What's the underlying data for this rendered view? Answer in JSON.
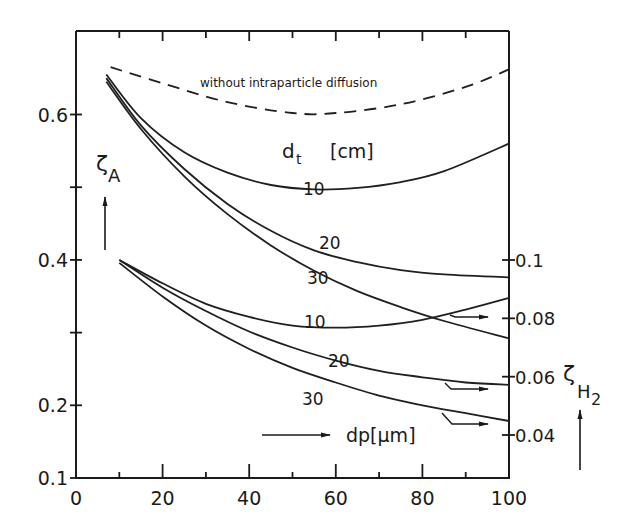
{
  "chart_data": {
    "type": "line",
    "title": "",
    "xlabel": "dp [µm]",
    "ylabel_left": "ζA",
    "ylabel_right": "ζH2",
    "xlim": [
      0,
      100
    ],
    "ylim_left": [
      0.1,
      0.7
    ],
    "ylim_right": [
      0.03,
      0.1
    ],
    "x_ticks": [
      0,
      20,
      40,
      60,
      80,
      100
    ],
    "x_ticks_labels": [
      "0",
      "20",
      "40",
      "60",
      "80",
      "100"
    ],
    "y_left_ticks_labels": [
      "0.1",
      "0.2",
      "0.4",
      "0.6"
    ],
    "y_left_ticks": [
      0.1,
      0.2,
      0.3,
      0.4,
      0.5,
      0.6
    ],
    "y_right_ticks_labels": [
      "0.04",
      "0.06",
      "0.08",
      "0.1"
    ],
    "y_right_ticks": [
      0.04,
      0.06,
      0.08,
      0.1
    ],
    "grid": false,
    "annotations": {
      "dashed_label": "without intraparticle diffusion",
      "dt_label": "d",
      "dt_sub": "t",
      "dt_unit": "[cm]",
      "x_arrow_label": "dp[µm]",
      "y_left_symbol": "ζ",
      "y_left_sub": "A",
      "y_right_symbol": "ζ",
      "y_right_sub": "H",
      "y_right_sub2": "2"
    },
    "series": [
      {
        "name": "without intraparticle diffusion",
        "axis": "left",
        "style": "dashed",
        "x": [
          8,
          20,
          35,
          50,
          60,
          75,
          90,
          100
        ],
        "values": [
          0.665,
          0.643,
          0.617,
          0.602,
          0.602,
          0.614,
          0.638,
          0.662
        ]
      },
      {
        "name": "ζA dt=10 cm",
        "axis": "left",
        "label": "10",
        "x": [
          7,
          15,
          25,
          35,
          45,
          55,
          65,
          75,
          85,
          100
        ],
        "values": [
          0.655,
          0.595,
          0.548,
          0.52,
          0.503,
          0.497,
          0.499,
          0.507,
          0.522,
          0.56
        ]
      },
      {
        "name": "ζA dt=20 cm",
        "axis": "left",
        "label": "20",
        "x": [
          7,
          15,
          25,
          35,
          45,
          55,
          65,
          75,
          85,
          100
        ],
        "values": [
          0.65,
          0.585,
          0.525,
          0.477,
          0.44,
          0.413,
          0.397,
          0.386,
          0.38,
          0.376
        ]
      },
      {
        "name": "ζA dt=30 cm",
        "axis": "left",
        "label": "30",
        "x": [
          7,
          15,
          25,
          35,
          45,
          55,
          65,
          75,
          85,
          100
        ],
        "values": [
          0.645,
          0.58,
          0.515,
          0.463,
          0.42,
          0.385,
          0.357,
          0.335,
          0.316,
          0.292
        ]
      },
      {
        "name": "ζH2 dt=10 cm",
        "axis": "right",
        "label": "10",
        "x": [
          10,
          20,
          30,
          40,
          50,
          60,
          70,
          80,
          90,
          100
        ],
        "values": [
          0.1,
          0.092,
          0.085,
          0.0805,
          0.0775,
          0.0768,
          0.0775,
          0.0795,
          0.083,
          0.087
        ]
      },
      {
        "name": "ζH2 dt=20 cm",
        "axis": "right",
        "label": "20",
        "x": [
          10,
          20,
          30,
          40,
          50,
          60,
          70,
          80,
          90,
          100
        ],
        "values": [
          0.1,
          0.0905,
          0.0825,
          0.0755,
          0.07,
          0.0655,
          0.062,
          0.0598,
          0.058,
          0.0572
        ]
      },
      {
        "name": "ζH2 dt=30 cm",
        "axis": "right",
        "label": "30",
        "x": [
          10,
          20,
          30,
          40,
          50,
          60,
          70,
          80,
          90,
          100
        ],
        "values": [
          0.099,
          0.0875,
          0.0775,
          0.0695,
          0.063,
          0.058,
          0.0535,
          0.0502,
          0.0475,
          0.0448
        ]
      }
    ]
  }
}
